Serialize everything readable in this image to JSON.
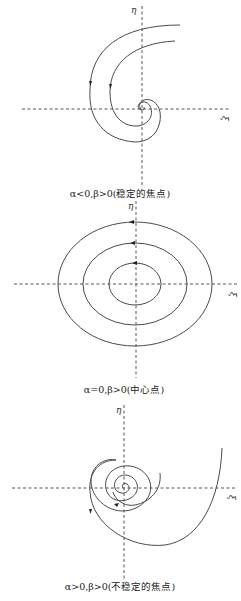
{
  "panels": [
    {
      "id": "stable-focus",
      "axis_labels": {
        "x": "ξ",
        "y": "η"
      },
      "caption": "α<0,β>0(稳定的焦点)",
      "trajectory_direction": "spiral inward toward origin"
    },
    {
      "id": "center",
      "axis_labels": {
        "x": "ξ",
        "y": "η"
      },
      "caption": "α=0,β>0(中心点)",
      "trajectory_direction": "closed ellipses, counter-clockwise"
    },
    {
      "id": "unstable-focus",
      "axis_labels": {
        "x": "ξ",
        "y": "η"
      },
      "caption": "α>0,β>0(不稳定的焦点)",
      "trajectory_direction": "spiral outward from origin"
    }
  ],
  "colors": {
    "curve": "#4a4a4a",
    "axis": "#444444",
    "text": "#222222"
  }
}
